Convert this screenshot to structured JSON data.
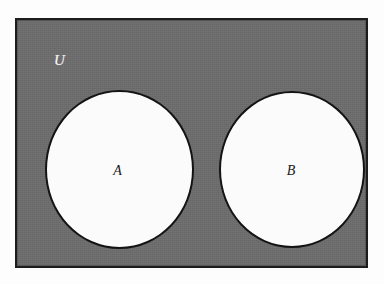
{
  "figure": {
    "kind": "venn-diagram",
    "caption": ""
  },
  "universe": {
    "label": "U",
    "fill_color": "#6d6d6d",
    "border_color": "#1d1d1d",
    "label_color": "#f4f4f4"
  },
  "sets": [
    {
      "id": "A",
      "label": "A",
      "fill_color": "#fbfbfb",
      "border_color": "#141414",
      "label_color": "#1a1a1a"
    },
    {
      "id": "B",
      "label": "B",
      "fill_color": "#fbfbfb",
      "border_color": "#141414",
      "label_color": "#1a1a1a"
    }
  ],
  "page": {
    "background_color": "#ffffff"
  }
}
